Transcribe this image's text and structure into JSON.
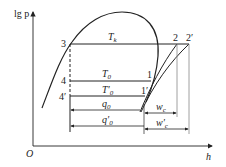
{
  "diagram": {
    "type": "lgp-h refrigeration cycle diagram",
    "axes": {
      "y_label": "lg p",
      "x_label": "h",
      "origin_label": "O"
    },
    "points": {
      "p3": "3",
      "p4": "4",
      "p4p": "4′",
      "p1": "1",
      "p1p": "1′",
      "p2": "2",
      "p2p": "2′"
    },
    "labels": {
      "Tk": {
        "main": "T",
        "sub": "k"
      },
      "T0": {
        "main": "T",
        "sub": "0"
      },
      "T0p": {
        "main": "T′",
        "sub": "0"
      },
      "q0": {
        "main": "q",
        "sub": "0"
      },
      "q0p": {
        "main": "q′",
        "sub": "0"
      },
      "wc": {
        "main": "w",
        "sub": "c"
      },
      "wcp": {
        "main": "w′",
        "sub": "c"
      }
    },
    "colors": {
      "line": "#222222",
      "guide": "#888888",
      "background": "#ffffff"
    }
  }
}
